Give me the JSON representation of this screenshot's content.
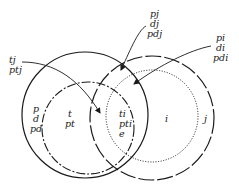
{
  "diagram": {
    "type": "venn",
    "colors": {
      "stroke": "#1a1a1a",
      "background": "#ffffff"
    },
    "sets": [
      {
        "name": "p-d-circle",
        "style": "solid",
        "labels": [
          "p",
          "d",
          "pd"
        ]
      },
      {
        "name": "t-circle",
        "style": "dash-dot",
        "labels": [
          "t",
          "pt"
        ]
      },
      {
        "name": "j-circle",
        "style": "long-dash",
        "labels": [
          "j"
        ]
      },
      {
        "name": "i-circle",
        "style": "dotted",
        "labels": [
          "i"
        ]
      }
    ],
    "regions": {
      "left_outer": [
        "p",
        "d",
        "pd"
      ],
      "t_only": [
        "t",
        "pt"
      ],
      "center": [
        "ti",
        "pti",
        "e"
      ],
      "i_only": [
        "i"
      ],
      "j_only": [
        "j"
      ]
    },
    "callouts": {
      "tj": [
        "tj",
        "ptj"
      ],
      "pj": [
        "pj",
        "dj",
        "pdj"
      ],
      "pi": [
        "pi",
        "di",
        "pdi"
      ]
    }
  }
}
